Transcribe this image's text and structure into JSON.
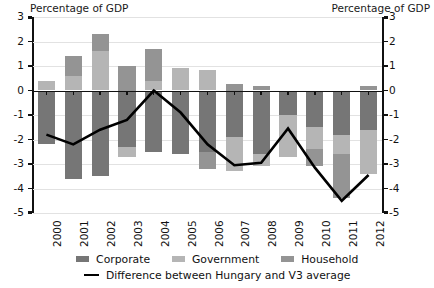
{
  "titles": {
    "left": "Percentage of GDP",
    "right": "Percentage of GDP"
  },
  "legend": {
    "corporate": "Corporate",
    "government": "Government",
    "household": "Household",
    "difference": "Difference between Hungary and V3 average"
  },
  "colors": {
    "corporate": "#767676",
    "government": "#b5b5b5",
    "household": "#949494",
    "line": "#000000",
    "gridline": "#e2e2e2",
    "axis": "#111111"
  },
  "chart_data": {
    "type": "bar",
    "title": "",
    "subtitle": "",
    "xlabel": "",
    "ylabel": "Percentage of GDP",
    "ylim": [
      -5,
      3
    ],
    "yticks": [
      3,
      2,
      1,
      0,
      -1,
      -2,
      -3,
      -4,
      -5
    ],
    "ytick_labels": [
      "3",
      "2",
      "1",
      "0",
      "-1",
      "-2",
      "-3",
      "-4",
      "-5"
    ],
    "grid": true,
    "stacked": true,
    "dual_axis": true,
    "legend_position": "bottom",
    "categories": [
      "2000",
      "2001",
      "2002",
      "2003",
      "2004",
      "2005",
      "2006",
      "2007",
      "2008",
      "2009",
      "2010",
      "2011",
      "2012"
    ],
    "series": [
      {
        "name": "Corporate",
        "type": "bar",
        "color": "#767676",
        "values": [
          -2.2,
          -3.6,
          -3.5,
          -2.3,
          -2.5,
          -2.6,
          -2.5,
          -1.9,
          -2.6,
          -1.0,
          -1.5,
          -1.8,
          -1.6
        ]
      },
      {
        "name": "Government",
        "type": "bar",
        "color": "#b5b5b5",
        "values": [
          0.4,
          0.6,
          1.6,
          -0.4,
          0.4,
          0.9,
          0.85,
          -1.4,
          -0.5,
          -1.7,
          -0.9,
          -0.8,
          -1.8
        ]
      },
      {
        "name": "Household",
        "type": "bar",
        "color": "#949494",
        "values": [
          0.0,
          0.8,
          0.7,
          1.0,
          1.3,
          0.0,
          -0.7,
          0.25,
          0.2,
          0.0,
          -0.7,
          -1.8,
          0.2
        ]
      },
      {
        "name": "Difference between Hungary and V3 average",
        "type": "line",
        "color": "#000000",
        "values": [
          -1.8,
          -2.2,
          -1.6,
          -1.2,
          0.0,
          -0.9,
          -2.2,
          -3.05,
          -2.95,
          -1.55,
          -3.15,
          -4.5,
          -3.45
        ]
      }
    ]
  }
}
